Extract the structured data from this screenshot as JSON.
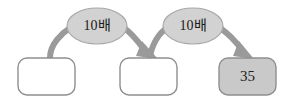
{
  "diagram": {
    "type": "flow-chain",
    "background_color": "#ffffff",
    "boxes": [
      {
        "id": "box-1",
        "value": "",
        "fill": "#ffffff",
        "stroke": "#8f8f8f",
        "x": 18,
        "y": 58,
        "width": 57,
        "height": 37,
        "filled": false
      },
      {
        "id": "box-2",
        "value": "",
        "fill": "#ffffff",
        "stroke": "#8f8f8f",
        "x": 120,
        "y": 58,
        "width": 57,
        "height": 37,
        "filled": false
      },
      {
        "id": "box-3",
        "value": "35",
        "fill": "#c9c9c9",
        "stroke": "#8f8f8f",
        "x": 219,
        "y": 58,
        "width": 57,
        "height": 37,
        "filled": true
      }
    ],
    "arrows": [
      {
        "id": "arrow-1",
        "label": "10배",
        "from": "box-1",
        "to": "box-2",
        "color": "#9a9a9a",
        "ellipse": {
          "cx": 97,
          "cy": 26,
          "rx": 30,
          "ry": 18,
          "fill": "#d2d2d2",
          "stroke": "#a8a8a8"
        }
      },
      {
        "id": "arrow-2",
        "label": "10배",
        "from": "box-2",
        "to": "box-3",
        "color": "#9a9a9a",
        "ellipse": {
          "cx": 193,
          "cy": 26,
          "rx": 30,
          "ry": 18,
          "fill": "#d2d2d2",
          "stroke": "#a8a8a8"
        }
      }
    ]
  }
}
